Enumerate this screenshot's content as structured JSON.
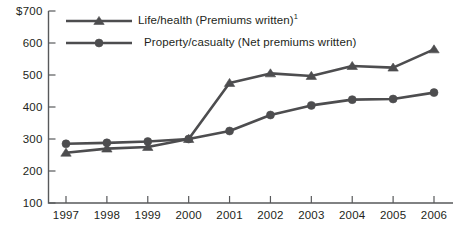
{
  "chart_data": {
    "type": "line",
    "title": "",
    "subtitle": "",
    "xlabel": "",
    "ylabel": "",
    "categories": [
      "1997",
      "1998",
      "1999",
      "2000",
      "2001",
      "2002",
      "2003",
      "2004",
      "2005",
      "2006"
    ],
    "x": [
      1997,
      1998,
      1999,
      2000,
      2001,
      2002,
      2003,
      2004,
      2005,
      2006
    ],
    "ylim": [
      100,
      700
    ],
    "yticks": [
      100,
      200,
      300,
      400,
      500,
      600,
      700
    ],
    "ytick_labels": [
      "100",
      "200",
      "300",
      "400",
      "500",
      "600",
      "$700"
    ],
    "grid": false,
    "legend_position": "top-left",
    "series": [
      {
        "name": "Life/health (Premiums written)¹",
        "name_base": "Life/health (Premiums written)",
        "footnote_marker": "1",
        "marker": "triangle",
        "color": "#4d4d4f",
        "values": [
          257,
          270,
          275,
          300,
          475,
          505,
          497,
          528,
          523,
          580
        ]
      },
      {
        "name": "Property/casualty (Net premiums written)",
        "name_base": "Property/casualty (Net premiums written)",
        "footnote_marker": "",
        "marker": "circle",
        "color": "#4d4d4f",
        "values": [
          285,
          288,
          292,
          300,
          325,
          375,
          405,
          423,
          425,
          445
        ]
      }
    ]
  },
  "axis": {
    "currency_prefix": "$",
    "line_color": "#58595b"
  }
}
